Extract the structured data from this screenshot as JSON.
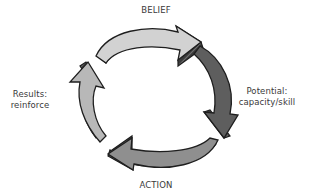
{
  "diagram": {
    "type": "cycle",
    "nodes": [
      {
        "id": "belief",
        "label": "BELIEF",
        "position": "top",
        "arrow_direction": "clockwise-right",
        "arrow_color": "#d2d2d2"
      },
      {
        "id": "potential",
        "label_lines": [
          "Potential:",
          "capacity/skill"
        ],
        "position": "right",
        "arrow_direction": "clockwise-down",
        "arrow_color": "#5e5e5e"
      },
      {
        "id": "action",
        "label": "ACTION",
        "position": "bottom",
        "arrow_direction": "clockwise-left",
        "arrow_color": "#8f8f8f"
      },
      {
        "id": "results",
        "label_lines": [
          "Results:",
          "reinforce"
        ],
        "position": "left",
        "arrow_direction": "clockwise-up",
        "arrow_color": "#b8b8b8"
      }
    ],
    "colors": {
      "outline": "#1e1e1e",
      "side": "#3a3a3a",
      "hatch": "#7a7a7a",
      "text": "#3a3a3a"
    }
  }
}
